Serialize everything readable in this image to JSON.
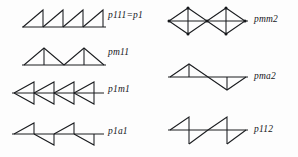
{
  "figure": {
    "type": "line-diagram",
    "background_color": "#fdfdfd",
    "ink_color": "#1a1c1f",
    "columns": 2,
    "rows_per_column": 4
  },
  "panels": [
    {
      "id": "p111",
      "column": "left",
      "row": 1,
      "label": "p111=p1",
      "motif": "row of four right triangles, hypotenuse rising left-to-right with vertical right edge, all same orientation (pure translation)",
      "repeat_count": 4
    },
    {
      "id": "pm11",
      "column": "left",
      "row": 2,
      "label": "pm11",
      "motif": "row of two symmetric isosceles triangles sharing a baseline with vertical mirror lines at the apexes",
      "repeat_count": 2
    },
    {
      "id": "p1m1",
      "column": "left",
      "row": 3,
      "label": "p1m1",
      "motif": "row of four leftward-pointing triangles bisected by a horizontal mirror line",
      "repeat_count": 4
    },
    {
      "id": "p1a1",
      "column": "left",
      "row": 4,
      "label": "p1a1",
      "motif": "alternating up and down right triangles along a horizontal glide line",
      "repeat_count": 4
    },
    {
      "id": "pmm2",
      "column": "right",
      "row": 1,
      "label": "pmm2",
      "motif": "two rhombi (bowtie pairs) with horizontal and vertical mirror lines and node dots at vertices",
      "repeat_count": 2
    },
    {
      "id": "pma2",
      "column": "right",
      "row": 2,
      "label": "pma2",
      "motif": "isosceles triangle above the axis with vertical mirror, followed by inverted triangle below the axis",
      "repeat_count": 2
    },
    {
      "id": "p112",
      "column": "right",
      "row": 3,
      "label": "p112",
      "motif": "zigzag of right triangles alternating above and below the axis, related by two-fold rotation",
      "repeat_count": 2
    }
  ],
  "labels": {
    "p111": "p111=p1",
    "pm11": "pm11",
    "p1m1": "p1m1",
    "p1a1": "p1a1",
    "pmm2": "pmm2",
    "pma2": "pma2",
    "p112": "p112"
  }
}
